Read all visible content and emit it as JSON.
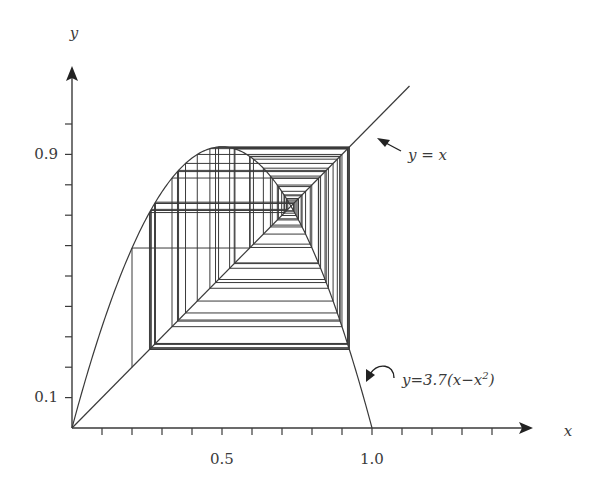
{
  "chart_data": {
    "type": "line",
    "title": "",
    "xlabel": "x",
    "ylabel": "y",
    "xlim": [
      0,
      1.55
    ],
    "ylim": [
      0,
      1.2
    ],
    "grid": false,
    "tick_labels": {
      "x": [
        {
          "value": 0.5,
          "label": "0.5"
        },
        {
          "value": 1.0,
          "label": "1.0"
        }
      ],
      "y": [
        {
          "value": 0.1,
          "label": "0.1"
        },
        {
          "value": 0.9,
          "label": "0.9"
        }
      ]
    },
    "x_ticks_step": 0.1,
    "x_ticks_count": 14,
    "y_ticks_step": 0.1,
    "y_ticks_count": 10,
    "series": [
      {
        "name": "y=3.7(x−x²)",
        "kind": "function",
        "r": 3.7,
        "domain": [
          0,
          1.0
        ]
      },
      {
        "name": "y = x",
        "kind": "identity",
        "domain": [
          0,
          1.125
        ]
      },
      {
        "name": "cobweb",
        "kind": "cobweb",
        "x0": 0.2,
        "r": 3.7,
        "iterations": 60
      }
    ],
    "annotations": [
      {
        "text": "y = x",
        "points_to": "identity line"
      },
      {
        "text_parts": [
          "y=3.7(x−x",
          "2",
          ")"
        ],
        "points_to": "logistic curve"
      }
    ],
    "fixed_point": 0.7297
  },
  "labels": {
    "x_axis": "x",
    "y_axis": "y",
    "tick_05": "0.5",
    "tick_10": "1.0",
    "tick_01": "0.1",
    "tick_09": "0.9",
    "identity_annotation": "y = x",
    "curve_annotation_main": "y=3.7(x−x",
    "curve_annotation_sup": "2",
    "curve_annotation_end": ")"
  },
  "colors": {
    "line": "#3a3a3a",
    "background": "#ffffff"
  }
}
